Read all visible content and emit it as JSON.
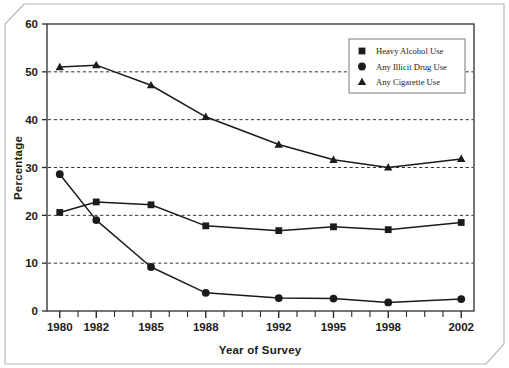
{
  "chart_data": {
    "type": "line",
    "title": "",
    "subtitle": "",
    "xlabel": "Year of Survey",
    "ylabel": "Percentage",
    "x": [
      1980,
      1982,
      1985,
      1988,
      1992,
      1995,
      1998,
      2002
    ],
    "x_tick_labels": [
      "1980",
      "1982",
      "1985",
      "1988",
      "1992",
      "1995",
      "1998",
      "2002"
    ],
    "x_minor_ticks_every": 1,
    "xlim": [
      1979.3,
      2002.7
    ],
    "ylim": [
      0,
      60
    ],
    "y_ticks": [
      0,
      10,
      20,
      30,
      40,
      50,
      60
    ],
    "y_tick_labels": [
      "0",
      "10",
      "20",
      "30",
      "40",
      "50",
      "60"
    ],
    "gridlines": [
      10,
      20,
      30,
      40,
      50
    ],
    "grid": "horizontal-dashed",
    "legend_position": "top-right",
    "series": [
      {
        "name": "Heavy Alcohol Use",
        "marker": "square",
        "color": "#1b1b1b",
        "values": [
          20.6,
          22.8,
          22.2,
          17.8,
          16.8,
          17.6,
          17.0,
          18.5
        ]
      },
      {
        "name": "Any Illicit Drug Use",
        "marker": "circle",
        "color": "#1b1b1b",
        "values": [
          28.6,
          19.0,
          9.2,
          3.8,
          2.7,
          2.6,
          1.8,
          2.5
        ]
      },
      {
        "name": "Any Cigarette Use",
        "marker": "triangle",
        "color": "#1b1b1b",
        "values": [
          51.0,
          51.4,
          47.2,
          40.6,
          34.8,
          31.6,
          30.0,
          31.8
        ]
      }
    ]
  },
  "legend": {
    "items": [
      {
        "label": "Heavy Alcohol Use",
        "marker": "square"
      },
      {
        "label": "Any Illicit Drug Use",
        "marker": "circle"
      },
      {
        "label": "Any Cigarette Use",
        "marker": "triangle"
      }
    ]
  },
  "colors": {
    "ink": "#1b1b1b",
    "axis": "#2b2b2b",
    "grid": "#333333",
    "frame": "#b8b8b8",
    "background": "#ffffff"
  }
}
